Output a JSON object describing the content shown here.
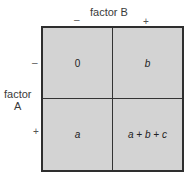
{
  "column_factor": {
    "label": "factor B",
    "levels": [
      "–",
      "+"
    ]
  },
  "row_factor": {
    "label_line1": "factor",
    "label_line2": "A",
    "levels": [
      "–",
      "+"
    ]
  },
  "cells": [
    {
      "row": "–",
      "col": "–",
      "value": "0"
    },
    {
      "row": "–",
      "col": "+",
      "value": "b"
    },
    {
      "row": "+",
      "col": "–",
      "value": "a"
    },
    {
      "row": "+",
      "col": "+",
      "value": "a + b + c"
    }
  ],
  "colors": {
    "cell_fill": "#d3d3d3",
    "border": "#2e2e2e"
  }
}
